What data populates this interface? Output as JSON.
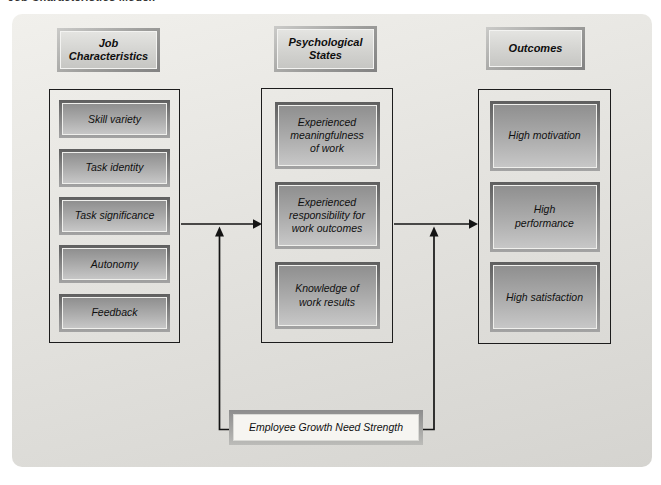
{
  "caption": "Job Characteristics Model.",
  "columns": [
    {
      "header": "Job\nCharacteristics",
      "items": [
        "Skill variety",
        "Task identity",
        "Task significance",
        "Autonomy",
        "Feedback"
      ]
    },
    {
      "header": "Psychological\nStates",
      "items": [
        "Experienced\nmeaningfulness\nof work",
        "Experienced\nresponsibility for\nwork outcomes",
        "Knowledge of\nwork results"
      ]
    },
    {
      "header": "Outcomes",
      "items": [
        "High motivation",
        "High\nperformance",
        "High satisfaction"
      ]
    }
  ],
  "moderator": {
    "label": "Employee Growth Need Strength"
  },
  "connections": [
    {
      "from": "job-characteristics",
      "to": "psychological-states",
      "style": "arrow-right"
    },
    {
      "from": "psychological-states",
      "to": "outcomes",
      "style": "arrow-right"
    },
    {
      "from": "employee-growth-need-strength",
      "to": "arrow job-characteristics→psychological-states",
      "style": "arrow-up"
    },
    {
      "from": "employee-growth-need-strength",
      "to": "arrow psychological-states→outcomes",
      "style": "arrow-up"
    }
  ],
  "colors": {
    "panel_top": "#f1f0ec",
    "panel_bottom": "#d5d4d0",
    "node_frame": "#5f5f5f",
    "node_fill_top": "#8f8f8f",
    "node_fill_bottom": "#c7c7c7",
    "node_outline": "#efefec",
    "header_fill": "#d3d3d0",
    "rule": "#1c1c1c",
    "arrow": "#141414",
    "moderator_fill": "#f6f5f1"
  }
}
